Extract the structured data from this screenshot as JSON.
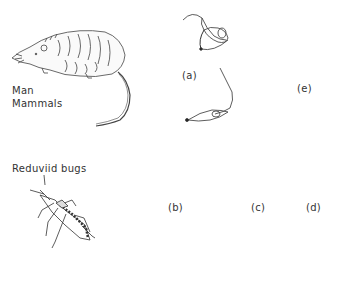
{
  "hosts": {
    "mammal_label_1": "Man",
    "mammal_label_2": "Mammals",
    "vector_label": "Reduviid bugs"
  },
  "stages": {
    "a": "(a)",
    "b": "(b)",
    "c": "(c)",
    "d": "(d)",
    "e": "(e)"
  },
  "diagram": {
    "type": "life-cycle",
    "nodes": [
      {
        "id": "mammal",
        "icon": "opossum-illustration"
      },
      {
        "id": "bug",
        "icon": "reduviid-bug-illustration"
      },
      {
        "id": "a",
        "label": "(a)",
        "form": "trypomastigotes in blood"
      },
      {
        "id": "b",
        "label": "(b)",
        "form": "amastigote to dividing forms"
      },
      {
        "id": "c",
        "label": "(c)",
        "form": "epimastigote"
      },
      {
        "id": "d",
        "label": "(d)",
        "form": "metacyclic trypomastigote"
      },
      {
        "id": "e",
        "label": "(e)",
        "form": "intracellular amastigotes / pseudocyst"
      }
    ],
    "edges": [
      [
        "a",
        "b"
      ],
      [
        "b",
        "c"
      ],
      [
        "c",
        "d"
      ],
      [
        "d",
        "e"
      ],
      [
        "e",
        "a"
      ]
    ]
  }
}
